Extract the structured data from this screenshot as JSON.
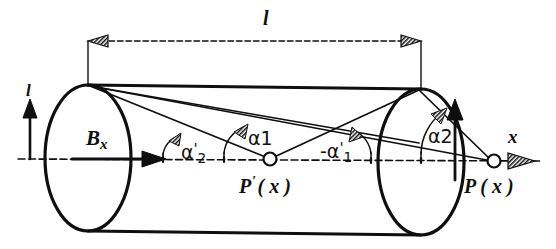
{
  "figure": {
    "background_color": "#ffffff",
    "stroke_color": "#0f0f0f",
    "width": 556,
    "height": 249
  },
  "labels": {
    "length_dimension": "l",
    "current_left": "l",
    "field_vector": "B",
    "field_vector_subscript": "x",
    "angle_alpha2_prime": "α",
    "angle_alpha2_prime_sub": "2",
    "angle_alpha2_prime_mark": "'",
    "angle_alpha1": "α1",
    "angle_neg_alpha1_prime": "-α",
    "angle_neg_alpha1_prime_sub": "1",
    "angle_neg_alpha1_prime_mark": "'",
    "angle_alpha2": "α2",
    "axis_x": "x",
    "point_p_prime": "P",
    "point_p_prime_mark": "'",
    "point_p_prime_arg": "( x )",
    "point_p": "P",
    "point_p_arg": "( x )"
  },
  "elements": {
    "left_ellipse": "cylinder-left-end-cap",
    "right_ellipse": "cylinder-right-end-cap",
    "axis_line": "dash-dot-center-axis",
    "dimension_line": "length-dimension-line",
    "point_marker_style": "open-circle"
  },
  "geometry": {
    "left_ellipse_center_x": 88,
    "left_ellipse_center_y": 158,
    "left_ellipse_rx": 43,
    "left_ellipse_ry": 73,
    "right_ellipse_center_x": 421,
    "right_ellipse_center_y": 162,
    "right_ellipse_rx": 43,
    "right_ellipse_ry": 73,
    "axis_y": 159,
    "p_prime_x": 270,
    "p_prime_y": 160,
    "p_x": 494,
    "p_y": 162,
    "dimension_y": 41,
    "dimension_left_x": 88,
    "dimension_right_x": 421
  }
}
